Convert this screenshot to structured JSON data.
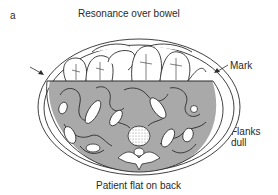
{
  "figure": {
    "panel_letter": "a",
    "title": "Resonance over bowel",
    "caption": "Patient flat on back",
    "labels": {
      "mark": "Mark",
      "flanks_line1": "Flanks",
      "flanks_line2": "dull"
    },
    "colors": {
      "fluid_shading": "#a9a9a9",
      "outline": "#2b2b2b",
      "background": "#ffffff",
      "bowel_fill": "#ffffff"
    },
    "elements": [
      "abdominal-wall-outline",
      "fluid-level-mark-line",
      "bowel-loops",
      "vertebra",
      "left-arrow",
      "right-arrow"
    ]
  }
}
